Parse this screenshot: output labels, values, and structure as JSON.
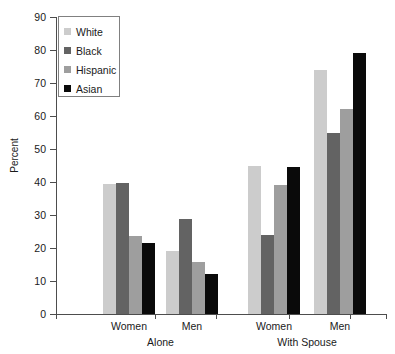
{
  "chart_data": {
    "type": "bar",
    "title": "",
    "xlabel": "",
    "ylabel": "Percent",
    "ylim": [
      0,
      90
    ],
    "ytick_step": 10,
    "grid": false,
    "legend_position": "top-left",
    "categories": [
      "Women",
      "Men",
      "Women",
      "Men"
    ],
    "group_labels": [
      "Alone",
      "With Spouse"
    ],
    "yticks": [
      "0",
      "10",
      "20",
      "30",
      "40",
      "50",
      "60",
      "70",
      "80",
      "90"
    ],
    "series": [
      {
        "name": "White",
        "color": "#cccccc",
        "values": [
          39.5,
          19.0,
          45.0,
          74.0
        ]
      },
      {
        "name": "Black",
        "color": "#636363",
        "values": [
          39.8,
          28.8,
          23.8,
          55.0
        ]
      },
      {
        "name": "Hispanic",
        "color": "#9e9e9e",
        "values": [
          23.5,
          15.8,
          39.0,
          62.0
        ]
      },
      {
        "name": "Asian",
        "color": "#0a0a0a",
        "values": [
          21.5,
          12.0,
          44.5,
          79.0
        ]
      }
    ]
  },
  "axis": {
    "y_title": "Percent"
  },
  "legend": {
    "entries": [
      "White",
      "Black",
      "Hispanic",
      "Asian"
    ]
  }
}
